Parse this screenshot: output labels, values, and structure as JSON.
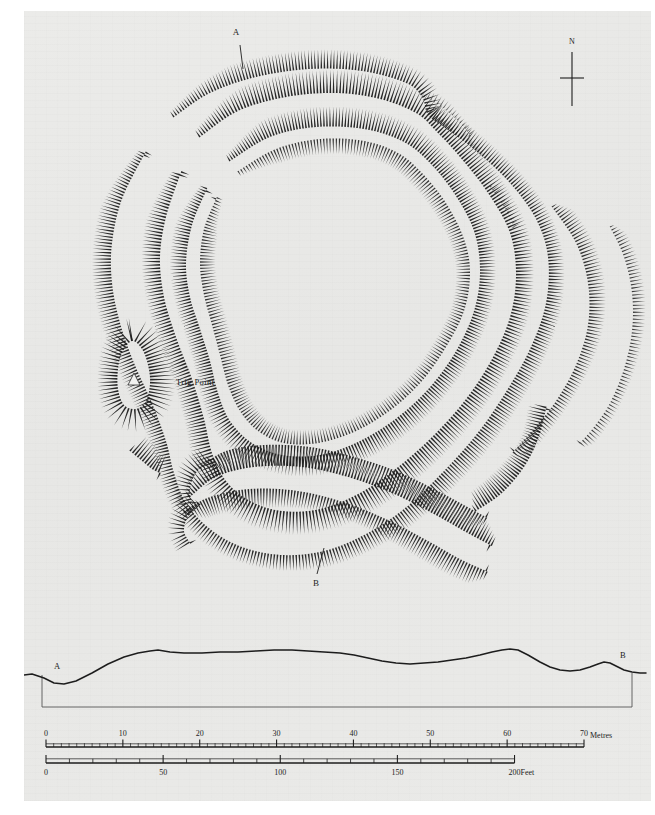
{
  "sheet": {
    "background_color": "#e9e9e7",
    "ink_color": "#1d1d1d",
    "page_margin_color": "#ffffff"
  },
  "plan": {
    "title": "Hillfort earthwork survey plan",
    "section_line_labels": {
      "north_end": "A",
      "south_end": "B"
    },
    "annotations": [
      {
        "name": "trig-point",
        "label": "Trig Point",
        "marker": "triangle"
      }
    ],
    "compass": {
      "label": "N",
      "style": "cross-with-needle"
    },
    "earthwork_convention": "hachures",
    "rampart_count": 4
  },
  "profile": {
    "left_label": "A",
    "right_label": "B",
    "caption": "Section A-B",
    "ground_line_points": "0,44 8,43 20,47 30,52 40,53 52,50 68,42 84,33 100,26 114,22 126,20 134,19 146,21 160,22 178,22 196,21 214,21 232,20 250,19 268,19 284,20 300,21 316,22 330,24 344,27 358,30 372,32 386,33 400,32 414,31 428,29 442,27 456,24 468,21 478,19 486,18 494,19 504,24 516,31 526,36 536,39 546,40 556,39 566,36 574,33 580,31 586,32 592,35 600,39 608,41 616,42 622,42"
  },
  "scale_metric": {
    "unit_label": "Metres",
    "min": 0,
    "max": 70,
    "major_step": 10,
    "minor_step": 1,
    "tick_labels": [
      "0",
      "10",
      "20",
      "30",
      "40",
      "50",
      "60",
      "70"
    ]
  },
  "scale_imperial": {
    "unit_label": "Feet",
    "min": 0,
    "max": 200,
    "major_step": 50,
    "minor_step": 10,
    "tick_labels": [
      "0",
      "50",
      "100",
      "150",
      "200"
    ]
  }
}
